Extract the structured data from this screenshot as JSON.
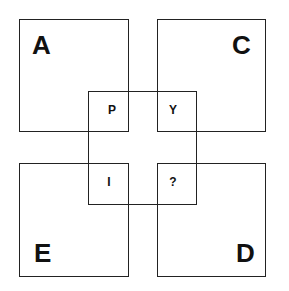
{
  "puzzle": {
    "outer_squares": [
      {
        "id": "top-left",
        "label": "A"
      },
      {
        "id": "top-right",
        "label": "C"
      },
      {
        "id": "bottom-left",
        "label": "E"
      },
      {
        "id": "bottom-right",
        "label": "D"
      }
    ],
    "inner_cells": [
      {
        "id": "top-left",
        "label": "P"
      },
      {
        "id": "top-right",
        "label": "Y"
      },
      {
        "id": "bottom-left",
        "label": "I"
      },
      {
        "id": "bottom-right",
        "label": "?"
      }
    ]
  }
}
